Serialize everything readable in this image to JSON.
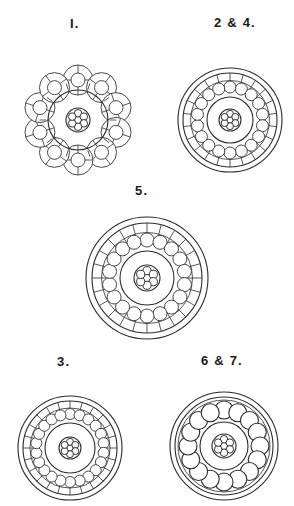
{
  "plate": {
    "title": "Transverse sections of fibre bundles",
    "background_color": "#ffffff",
    "ink_color": "#2b2b2b",
    "width": 294,
    "height": 506
  },
  "figures": [
    {
      "id": "fig-1",
      "label": "I.",
      "label_x": 70,
      "label_y": 16,
      "cx": 78,
      "cy": 120,
      "outer_radius": 55,
      "style": "lobed-rosette",
      "lobe_count": 10,
      "lobe_radius": 15,
      "lobe_inner_radius": 7,
      "lobe_spokes": 4,
      "inner_ring_radius": 30,
      "core_radius": 12,
      "core_dot_count": 7,
      "description": "Ten wheel-like lobes arranged in a ring around a plain central circle containing a seven-dot rosette core"
    },
    {
      "id": "fig-2-4",
      "label": "2 & 4.",
      "label_x": 214,
      "label_y": 15,
      "cx": 230,
      "cy": 120,
      "outer_radius": 52,
      "style": "spoked-double-ring",
      "outer_ring_gap": 5,
      "spoke_count": 22,
      "bead_count": 18,
      "bead_ring_radius": 33,
      "bead_radius": 6,
      "inner_ring_radius": 23,
      "core_radius": 11,
      "core_dot_count": 7,
      "description": "Double outer ring with radial spokes, a ring of eighteen small circles, an inner circle and a seven-dot rosette core"
    },
    {
      "id": "fig-5",
      "label": "5.",
      "label_x": 135,
      "label_y": 183,
      "cx": 147,
      "cy": 278,
      "outer_radius": 61,
      "style": "spoked-double-ring",
      "outer_ring_gap": 6,
      "spoke_count": 24,
      "bead_count": 18,
      "bead_ring_radius": 38,
      "bead_radius": 7,
      "inner_ring_radius": 27,
      "core_radius": 13,
      "core_dot_count": 7,
      "description": "Largest section: double outer ring with twenty-four spokes, ring of eighteen circles, inner circle and seven-dot rosette core"
    },
    {
      "id": "fig-3",
      "label": "3.",
      "label_x": 57,
      "label_y": 354,
      "cx": 70,
      "cy": 448,
      "outer_radius": 52,
      "style": "spoked-double-ring",
      "outer_ring_gap": 5,
      "spoke_count": 24,
      "bead_count": 22,
      "bead_ring_radius": 34,
      "bead_radius": 5.5,
      "inner_ring_radius": 25,
      "core_radius": 11,
      "core_dot_count": 7,
      "description": "Double outer ring with twenty-four spokes, close ring of twenty-two small circles, inner circle and seven-dot rosette core"
    },
    {
      "id": "fig-6-7",
      "label": "6 & 7.",
      "label_x": 201,
      "label_y": 353,
      "cx": 224,
      "cy": 446,
      "outer_radius": 54,
      "style": "beaded-double-ring",
      "outer_ring_gap": 5,
      "spoke_count": 0,
      "bead_count": 16,
      "bead_ring_radius": 36,
      "bead_radius": 9,
      "inner_ring_radius": 24,
      "core_radius": 12,
      "core_dot_count": 7,
      "description": "Double outer ring enclosing sixteen large circles, an inner circle and a seven-dot rosette core; no radial spokes"
    }
  ]
}
